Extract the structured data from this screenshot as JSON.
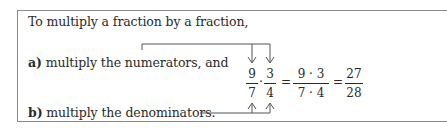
{
  "rule": {
    "intro": "To multiply a fraction by a fraction,",
    "step_a": {
      "label": "a)",
      "text": "multiply the numerators, and"
    },
    "step_b": {
      "label": "b)",
      "text": "multiply the denominators."
    }
  },
  "equation": {
    "left": {
      "num": "9",
      "den": "7"
    },
    "dot": "·",
    "right": {
      "num": "3",
      "den": "4"
    },
    "eq1": "=",
    "product": {
      "num": "9 · 3",
      "den": "7 · 4"
    },
    "eq2": "=",
    "result": {
      "num": "27",
      "den": "28"
    }
  }
}
